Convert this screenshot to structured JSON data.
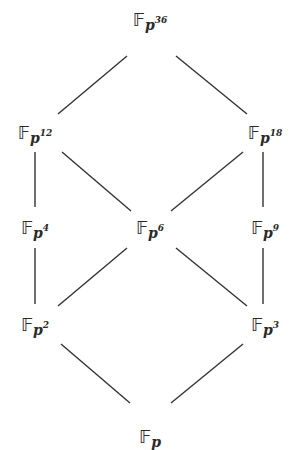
{
  "diagram": {
    "field_symbol": "𝔽",
    "base": "p",
    "nodes": [
      {
        "id": "n36",
        "exp": "36",
        "x": 150,
        "y": 20
      },
      {
        "id": "n12",
        "exp": "12",
        "x": 35,
        "y": 133
      },
      {
        "id": "n18",
        "exp": "18",
        "x": 265,
        "y": 133
      },
      {
        "id": "n4",
        "exp": "4",
        "x": 35,
        "y": 228
      },
      {
        "id": "n6",
        "exp": "6",
        "x": 150,
        "y": 228
      },
      {
        "id": "n9",
        "exp": "9",
        "x": 265,
        "y": 228
      },
      {
        "id": "n2",
        "exp": "2",
        "x": 35,
        "y": 325
      },
      {
        "id": "n3",
        "exp": "3",
        "x": 265,
        "y": 325
      },
      {
        "id": "n1",
        "exp": "",
        "x": 150,
        "y": 437
      }
    ],
    "edges": [
      {
        "from": "n36",
        "to": "n12",
        "x1": 127,
        "y1": 56,
        "x2": 58,
        "y2": 114
      },
      {
        "from": "n36",
        "to": "n18",
        "x1": 176,
        "y1": 56,
        "x2": 247,
        "y2": 114
      },
      {
        "from": "n12",
        "to": "n4",
        "x1": 35,
        "y1": 152,
        "x2": 35,
        "y2": 207
      },
      {
        "from": "n12",
        "to": "n6",
        "x1": 62,
        "y1": 152,
        "x2": 131,
        "y2": 211
      },
      {
        "from": "n18",
        "to": "n6",
        "x1": 243,
        "y1": 152,
        "x2": 171,
        "y2": 211
      },
      {
        "from": "n18",
        "to": "n9",
        "x1": 263,
        "y1": 152,
        "x2": 263,
        "y2": 207
      },
      {
        "from": "n4",
        "to": "n2",
        "x1": 35,
        "y1": 248,
        "x2": 35,
        "y2": 304
      },
      {
        "from": "n6",
        "to": "n2",
        "x1": 127,
        "y1": 248,
        "x2": 58,
        "y2": 306
      },
      {
        "from": "n6",
        "to": "n3",
        "x1": 176,
        "y1": 248,
        "x2": 247,
        "y2": 306
      },
      {
        "from": "n9",
        "to": "n3",
        "x1": 263,
        "y1": 248,
        "x2": 263,
        "y2": 304
      },
      {
        "from": "n2",
        "to": "n1",
        "x1": 61,
        "y1": 344,
        "x2": 130,
        "y2": 403
      },
      {
        "from": "n3",
        "to": "n1",
        "x1": 243,
        "y1": 344,
        "x2": 171,
        "y2": 403
      }
    ],
    "line_color": "#333333"
  }
}
